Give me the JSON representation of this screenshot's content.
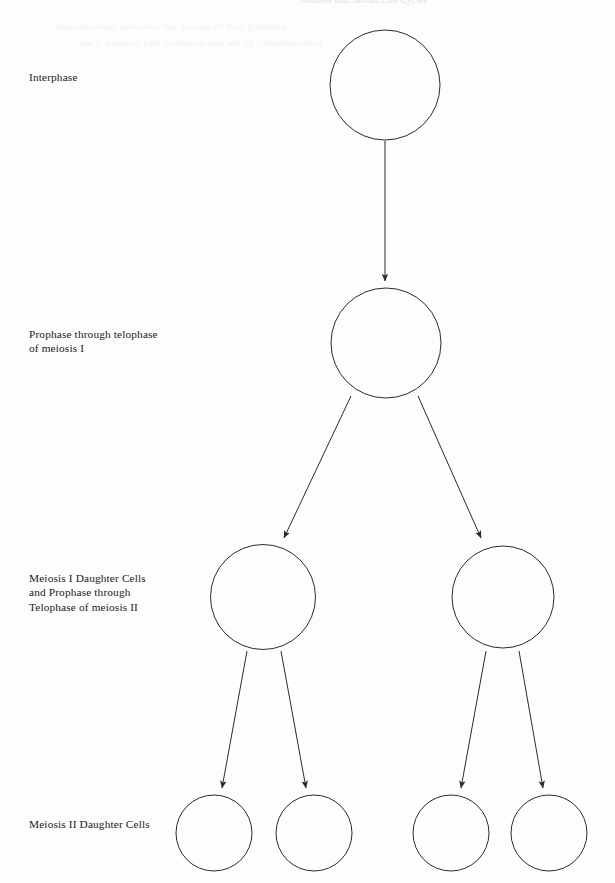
{
  "page": {
    "width": 615,
    "height": 883,
    "background_color": "#fdfdfd",
    "ink_color": "#2a2a2a",
    "text_color": "#1b1b1b",
    "header_partial_text": "Meiosis and Sexual Life Cycles",
    "bleed_through_text_1": "reproduction involves the fusion of two gametes",
    "bleed_through_text_2": "each haploid cell contains one set of chromosomes"
  },
  "diagram": {
    "type": "flow-diagram",
    "labels": [
      {
        "id": "interphase",
        "text": "Interphase"
      },
      {
        "id": "meiosis-i",
        "text": "Prophase  through telophase\nof meiosis I"
      },
      {
        "id": "daughter-i",
        "text": "Meiosis I Daughter Cells\nand Prophase through\nTelophase of meiosis II"
      },
      {
        "id": "daughter-ii",
        "text": "Meiosis II Daughter Cells"
      }
    ],
    "cells": [
      {
        "id": "interphase-cell",
        "cx": 385,
        "cy": 85,
        "r": 55,
        "stage": "interphase"
      },
      {
        "id": "meiosis-i-cell",
        "cx": 386,
        "cy": 343,
        "r": 55,
        "stage": "meiosis-i"
      },
      {
        "id": "daughter-i-left",
        "cx": 263,
        "cy": 597,
        "r": 52.5,
        "stage": "daughter-i"
      },
      {
        "id": "daughter-i-right",
        "cx": 503,
        "cy": 597,
        "r": 51,
        "stage": "daughter-i"
      },
      {
        "id": "daughter-ii-1",
        "cx": 214,
        "cy": 833,
        "r": 38,
        "stage": "daughter-ii"
      },
      {
        "id": "daughter-ii-2",
        "cx": 314,
        "cy": 833,
        "r": 38,
        "stage": "daughter-ii"
      },
      {
        "id": "daughter-ii-3",
        "cx": 451,
        "cy": 833,
        "r": 38,
        "stage": "daughter-ii"
      },
      {
        "id": "daughter-ii-4",
        "cx": 549,
        "cy": 833,
        "r": 38,
        "stage": "daughter-ii"
      }
    ],
    "arrows": [
      {
        "id": "arrow-interphase-to-meiosis-i",
        "x1": 385,
        "y1": 141,
        "x2": 385,
        "y2": 281
      },
      {
        "id": "arrow-meiosis-i-to-daughter-left",
        "x1": 351,
        "y1": 396,
        "x2": 284,
        "y2": 538
      },
      {
        "id": "arrow-meiosis-i-to-daughter-right",
        "x1": 418,
        "y1": 396,
        "x2": 481,
        "y2": 538
      },
      {
        "id": "arrow-daughter-left-to-ii-1",
        "x1": 247,
        "y1": 651,
        "x2": 222,
        "y2": 788
      },
      {
        "id": "arrow-daughter-left-to-ii-2",
        "x1": 281,
        "y1": 651,
        "x2": 306,
        "y2": 788
      },
      {
        "id": "arrow-daughter-right-to-ii-3",
        "x1": 486,
        "y1": 651,
        "x2": 461,
        "y2": 788
      },
      {
        "id": "arrow-daughter-right-to-ii-4",
        "x1": 519,
        "y1": 651,
        "x2": 543,
        "y2": 788
      }
    ]
  }
}
